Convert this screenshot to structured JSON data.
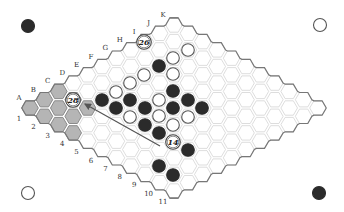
{
  "game": {
    "name": "Hex",
    "board_size": 11,
    "colors": {
      "black": "#2b2b2b",
      "white": "#ffffff",
      "grid": "#d4d4d4",
      "edge": "#777777",
      "shaded": "#b5b5b5",
      "arrow": "#555555"
    },
    "column_labels": [
      "A",
      "B",
      "C",
      "D",
      "E",
      "F",
      "G",
      "H",
      "I",
      "J",
      "K"
    ],
    "row_labels": [
      "1",
      "2",
      "3",
      "4",
      "5",
      "6",
      "7",
      "8",
      "9",
      "10",
      "11"
    ],
    "corner_markers": [
      {
        "position": "top-left",
        "color": "black"
      },
      {
        "position": "top-right",
        "color": "white"
      },
      {
        "position": "bottom-left",
        "color": "white"
      },
      {
        "position": "bottom-right",
        "color": "black"
      }
    ],
    "shaded_region": [
      "A1",
      "B1",
      "C1",
      "A2",
      "B2",
      "C2",
      "A3",
      "B3",
      "C3",
      "A4"
    ],
    "stones": [
      {
        "color": "white",
        "x": 188,
        "y": 50
      },
      {
        "color": "white",
        "x": 173,
        "y": 58
      },
      {
        "color": "black",
        "x": 159,
        "y": 66
      },
      {
        "color": "white",
        "x": 173,
        "y": 74
      },
      {
        "color": "white",
        "x": 144,
        "y": 75
      },
      {
        "color": "white",
        "x": 130,
        "y": 83
      },
      {
        "color": "black",
        "x": 173,
        "y": 91
      },
      {
        "color": "white",
        "x": 116,
        "y": 92
      },
      {
        "color": "black",
        "x": 102,
        "y": 100
      },
      {
        "color": "black",
        "x": 130,
        "y": 100
      },
      {
        "color": "white",
        "x": 159,
        "y": 100
      },
      {
        "color": "black",
        "x": 188,
        "y": 100
      },
      {
        "color": "black",
        "x": 116,
        "y": 108
      },
      {
        "color": "black",
        "x": 145,
        "y": 108
      },
      {
        "color": "white",
        "x": 159,
        "y": 116
      },
      {
        "color": "black",
        "x": 173,
        "y": 108
      },
      {
        "color": "black",
        "x": 202,
        "y": 108
      },
      {
        "color": "white",
        "x": 130,
        "y": 117
      },
      {
        "color": "white",
        "x": 188,
        "y": 117
      },
      {
        "color": "black",
        "x": 145,
        "y": 125
      },
      {
        "color": "white",
        "x": 173,
        "y": 125
      },
      {
        "color": "black",
        "x": 159,
        "y": 133
      },
      {
        "color": "black",
        "x": 188,
        "y": 150
      },
      {
        "color": "black",
        "x": 159,
        "y": 166
      },
      {
        "color": "black",
        "x": 173,
        "y": 175
      }
    ],
    "numbered_moves": [
      {
        "label": "26",
        "x": 144,
        "y": 42
      },
      {
        "label": "28",
        "x": 73,
        "y": 100
      },
      {
        "label": "14",
        "x": 173,
        "y": 142
      }
    ],
    "arrow": {
      "from": {
        "x": 160,
        "y": 146
      },
      "to": {
        "x": 85,
        "y": 104
      }
    }
  }
}
